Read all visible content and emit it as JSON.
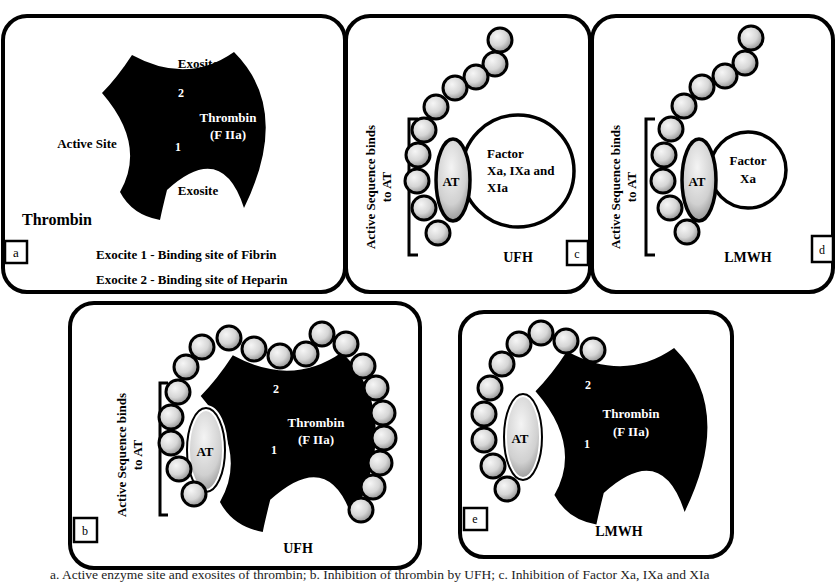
{
  "colors": {
    "outline": "#000000",
    "thrombin_fill": "#000000",
    "bead_light": "#f4f4f4",
    "bead_dark": "#8a8a8a",
    "background": "#ffffff"
  },
  "panels": {
    "a": {
      "tag": "a",
      "exosite_top": "Exosite",
      "exosite_bottom": "Exosite",
      "active_site": "Active Site",
      "site_2": "2",
      "site_1": "1",
      "thrombin_line1": "Thrombin",
      "thrombin_line2": "(F IIa)",
      "title": "Thrombin",
      "legend_1": "Exocite 1 - Binding site of Fibrin",
      "legend_2": "Exocite 2 - Binding site of Heparin"
    },
    "c": {
      "tag": "c",
      "bracket_line1": "Active Sequence binds",
      "bracket_line2": "to AT",
      "at_label": "AT",
      "factor_line1": "Factor",
      "factor_line2": "Xa, IXa and",
      "factor_line3": "XIa",
      "heparin": "UFH"
    },
    "d": {
      "tag": "d",
      "bracket_line1": "Active Sequence binds",
      "bracket_line2": "to AT",
      "at_label": "AT",
      "factor_line1": "Factor",
      "factor_line2": "Xa",
      "heparin": "LMWH"
    },
    "b": {
      "tag": "b",
      "bracket_line1": "Active Sequence binds",
      "bracket_line2": "to AT",
      "at_label": "AT",
      "site_2": "2",
      "site_1": "1",
      "thrombin_line1": "Thrombin",
      "thrombin_line2": "(F IIa)",
      "heparin": "UFH"
    },
    "e": {
      "tag": "e",
      "at_label": "AT",
      "site_2": "2",
      "site_1": "1",
      "thrombin_line1": "Thrombin",
      "thrombin_line2": "(F IIa)",
      "heparin": "LMWH"
    }
  },
  "caption": "a. Active enzyme site and exosites of thrombin; b. Inhibition of thrombin by UFH;  c. Inhibition of Factor Xa, IXa and XIa"
}
